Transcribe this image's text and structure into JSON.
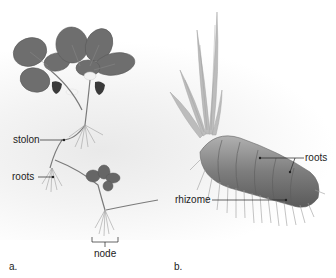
{
  "figure": {
    "panel_a": {
      "letter": "a.",
      "subject": "strawberry plant with stolon",
      "labels": {
        "stolon": "stolon",
        "roots": "roots",
        "node": "node"
      }
    },
    "panel_b": {
      "letter": "b.",
      "subject": "plant rhizome",
      "labels": {
        "roots": "roots",
        "rhizome": "rhizome"
      }
    }
  },
  "colors": {
    "leaf": "#6e6e6e",
    "leaf_dark": "#555555",
    "stem": "#7a7a7a",
    "root": "#9a9a9a",
    "rhizome": "#8a8a8a",
    "blade": "#b8b8b8",
    "leader": "#222222"
  }
}
